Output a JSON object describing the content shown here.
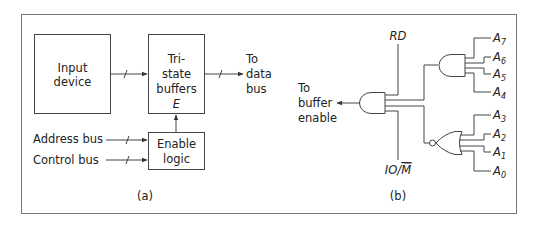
{
  "panel_a": {
    "caption": "(a)",
    "input_device": {
      "line1": "Input",
      "line2": "device"
    },
    "tristate": {
      "line1": "Tri-",
      "line2": "state",
      "line3": "buffers",
      "enable_pin": "E"
    },
    "output_label": {
      "line1": "To",
      "line2": "data",
      "line3": "bus"
    },
    "enable_logic": {
      "line1": "Enable",
      "line2": "logic"
    },
    "address_bus": "Address bus",
    "control_bus": "Control bus"
  },
  "panel_b": {
    "caption": "(b)",
    "output_label": {
      "line1": "To",
      "line2": "buffer",
      "line3": "enable"
    },
    "rd_label": "RD",
    "io_label": "IO/",
    "io_bar": "M",
    "upper_inputs": [
      {
        "letter": "A",
        "sub": "7"
      },
      {
        "letter": "A",
        "sub": "6"
      },
      {
        "letter": "A",
        "sub": "5"
      },
      {
        "letter": "A",
        "sub": "4"
      }
    ],
    "lower_inputs": [
      {
        "letter": "A",
        "sub": "3"
      },
      {
        "letter": "A",
        "sub": "2"
      },
      {
        "letter": "A",
        "sub": "1"
      },
      {
        "letter": "A",
        "sub": "0"
      }
    ]
  },
  "colors": {
    "line": "#555555",
    "frame": "#777777",
    "text": "#222222"
  }
}
